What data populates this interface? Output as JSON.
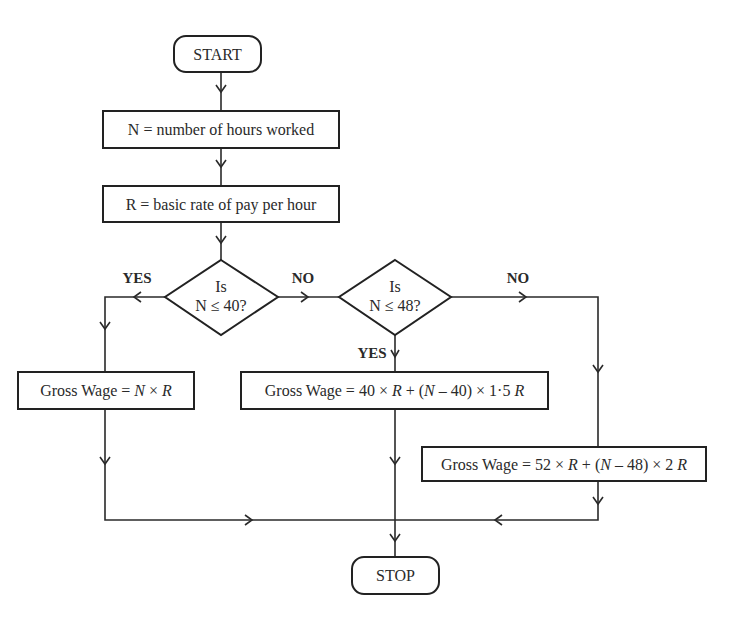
{
  "diagram": {
    "type": "flowchart",
    "nodes": {
      "start": {
        "kind": "terminal",
        "label": "START"
      },
      "input_n": {
        "kind": "process",
        "label": "N = number of hours worked"
      },
      "input_r": {
        "kind": "process",
        "label": "R = basic rate of pay per hour"
      },
      "decision1": {
        "kind": "decision",
        "line1": "Is",
        "line2": "N ≤ 40?"
      },
      "decision2": {
        "kind": "decision",
        "line1": "Is",
        "line2": "N ≤ 48?"
      },
      "wage_basic": {
        "kind": "process",
        "prefix": "Gross Wage = ",
        "n": "N",
        "times": " × ",
        "r": "R"
      },
      "wage_overtime1": {
        "kind": "process",
        "prefix": "Gross Wage = 40 × ",
        "r1": "R",
        "mid": " + (",
        "n": "N",
        "tail": " – 40) × 1·5 ",
        "r2": "R"
      },
      "wage_overtime2": {
        "kind": "process",
        "prefix": "Gross Wage = 52 × ",
        "r1": "R",
        "mid": " + (",
        "n": "N",
        "tail": " – 48) × 2 ",
        "r2": "R"
      },
      "stop": {
        "kind": "terminal",
        "label": "STOP"
      }
    },
    "edge_labels": {
      "d1_yes": "YES",
      "d1_no": "NO",
      "d2_yes": "YES",
      "d2_no": "NO"
    },
    "edges": [
      {
        "from": "start",
        "to": "input_n"
      },
      {
        "from": "input_n",
        "to": "input_r"
      },
      {
        "from": "input_r",
        "to": "decision1"
      },
      {
        "from": "decision1",
        "to": "wage_basic",
        "label": "YES"
      },
      {
        "from": "decision1",
        "to": "decision2",
        "label": "NO"
      },
      {
        "from": "decision2",
        "to": "wage_overtime1",
        "label": "YES"
      },
      {
        "from": "decision2",
        "to": "wage_overtime2",
        "label": "NO"
      },
      {
        "from": "wage_basic",
        "to": "stop"
      },
      {
        "from": "wage_overtime1",
        "to": "stop"
      },
      {
        "from": "wage_overtime2",
        "to": "stop"
      }
    ]
  }
}
